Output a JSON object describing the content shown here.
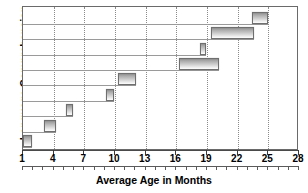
{
  "chart_data": {
    "type": "bar",
    "orientation": "horizontal",
    "subtype": "range-bar",
    "title": "",
    "xlabel": "Average Age in Months",
    "ylabel": "Language Comprehension",
    "xlim": [
      1,
      28
    ],
    "xticks": [
      1,
      4,
      7,
      10,
      13,
      16,
      19,
      22,
      25,
      28
    ],
    "xtick_labels": [
      "1",
      "4",
      "7",
      "10",
      "13",
      "16",
      "19",
      "22",
      "25",
      "28"
    ],
    "minor_tick_interval": 1,
    "grid": "vertical-dotted",
    "legend": "none",
    "ytick_labels": [],
    "categories": [
      "milestone-1",
      "milestone-2",
      "milestone-3",
      "milestone-4",
      "milestone-5",
      "milestone-6",
      "milestone-7",
      "milestone-8",
      "milestone-9"
    ],
    "series": [
      {
        "name": "Age range",
        "ranges": [
          {
            "row": 1,
            "start": 1.0,
            "end": 1.9
          },
          {
            "row": 2,
            "start": 3.1,
            "end": 4.2
          },
          {
            "row": 3,
            "start": 5.2,
            "end": 5.9
          },
          {
            "row": 4,
            "start": 9.1,
            "end": 9.9
          },
          {
            "row": 5,
            "start": 10.3,
            "end": 12.1
          },
          {
            "row": 6,
            "start": 16.3,
            "end": 20.2
          },
          {
            "row": 7,
            "start": 18.3,
            "end": 18.9
          },
          {
            "row": 8,
            "start": 19.4,
            "end": 23.6
          },
          {
            "row": 9,
            "start": 23.4,
            "end": 25.0
          }
        ]
      }
    ]
  },
  "axis": {
    "x_title": "Average Age in Months",
    "y_title": "Language Comprehension"
  },
  "colors": {
    "bar_border": "#6f6f6f",
    "bar_fill_dark": "#8e8e8e",
    "bar_fill_light": "#fdfdfd",
    "gridline": "#8a8a8a",
    "rowline": "#9a9a9a",
    "frame": "#6a6a6a",
    "axis": "#4a4a4a",
    "text": "#000000",
    "background": "#ffffff"
  }
}
